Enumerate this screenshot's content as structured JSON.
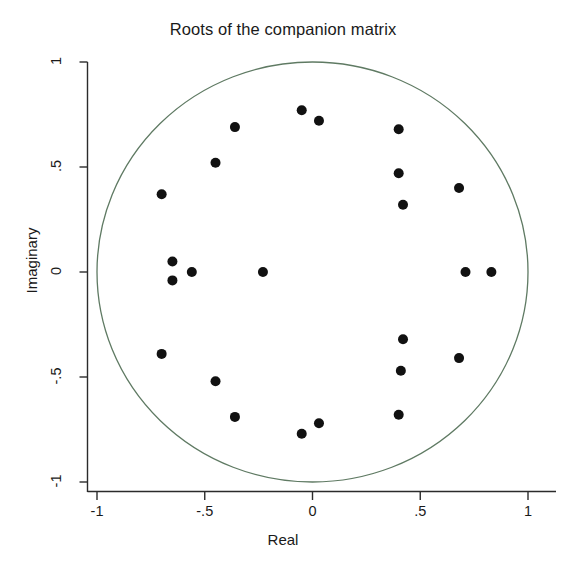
{
  "chart_data": {
    "type": "scatter",
    "title": "Roots of the companion matrix",
    "xlabel": "Real",
    "ylabel": "Imaginary",
    "xlim": [
      -1.12,
      1.18
    ],
    "ylim": [
      -1.12,
      1.12
    ],
    "xticks": [
      -1,
      -0.5,
      0,
      0.5,
      1
    ],
    "xticklabels": [
      "-1",
      "-.5",
      "0",
      ".5",
      "1"
    ],
    "yticks": [
      -1,
      -0.5,
      0,
      0.5,
      1
    ],
    "yticklabels": [
      "-1",
      "-.5",
      "0",
      ".5",
      "1"
    ],
    "grid": false,
    "legend": null,
    "marker_color": "#111111",
    "unit_circle": {
      "label": "unit circle",
      "center": [
        0,
        0
      ],
      "radius": 1,
      "color": "#5f7a63"
    },
    "points": [
      {
        "real": -0.05,
        "imaginary": 0.77
      },
      {
        "real": 0.03,
        "imaginary": 0.72
      },
      {
        "real": -0.36,
        "imaginary": 0.69
      },
      {
        "real": 0.4,
        "imaginary": 0.68
      },
      {
        "real": -0.45,
        "imaginary": 0.52
      },
      {
        "real": 0.4,
        "imaginary": 0.47
      },
      {
        "real": 0.68,
        "imaginary": 0.4
      },
      {
        "real": 0.42,
        "imaginary": 0.32
      },
      {
        "real": -0.7,
        "imaginary": 0.37
      },
      {
        "real": -0.65,
        "imaginary": 0.05
      },
      {
        "real": -0.56,
        "imaginary": 0.0
      },
      {
        "real": -0.23,
        "imaginary": 0.0
      },
      {
        "real": 0.71,
        "imaginary": 0.0
      },
      {
        "real": 0.83,
        "imaginary": 0.0
      },
      {
        "real": -0.65,
        "imaginary": -0.04
      },
      {
        "real": -0.7,
        "imaginary": -0.39
      },
      {
        "real": 0.42,
        "imaginary": -0.32
      },
      {
        "real": 0.68,
        "imaginary": -0.41
      },
      {
        "real": 0.41,
        "imaginary": -0.47
      },
      {
        "real": -0.45,
        "imaginary": -0.52
      },
      {
        "real": 0.4,
        "imaginary": -0.68
      },
      {
        "real": -0.36,
        "imaginary": -0.69
      },
      {
        "real": 0.03,
        "imaginary": -0.72
      },
      {
        "real": -0.05,
        "imaginary": -0.77
      }
    ]
  }
}
